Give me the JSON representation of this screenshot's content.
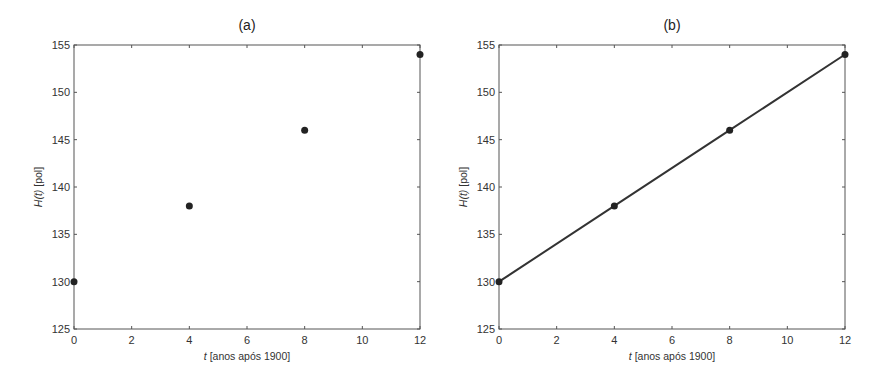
{
  "chart_data": [
    {
      "type": "scatter",
      "title": "(a)",
      "xlabel_italic": "t",
      "xlabel_rest": " [anos após 1900]",
      "ylabel_italic": "H(t)",
      "ylabel_rest": " [pol]",
      "xlabel": "t [anos após 1900]",
      "ylabel": "H(t) [pol]",
      "xlim": [
        0,
        12
      ],
      "ylim": [
        125,
        155
      ],
      "xticks": [
        0,
        2,
        4,
        6,
        8,
        10,
        12
      ],
      "yticks": [
        125,
        130,
        135,
        140,
        145,
        150,
        155
      ],
      "grid": false,
      "series": [
        {
          "name": "dados",
          "x": [
            0,
            4,
            8,
            12
          ],
          "y": [
            130,
            138,
            146,
            154
          ],
          "marker": "circle",
          "line": false
        }
      ]
    },
    {
      "type": "line",
      "title": "(b)",
      "xlabel_italic": "t",
      "xlabel_rest": " [anos após 1900]",
      "ylabel_italic": "H(t)",
      "ylabel_rest": " [pol]",
      "xlabel": "t [anos após 1900]",
      "ylabel": "H(t) [pol]",
      "xlim": [
        0,
        12
      ],
      "ylim": [
        125,
        155
      ],
      "xticks": [
        0,
        2,
        4,
        6,
        8,
        10,
        12
      ],
      "yticks": [
        125,
        130,
        135,
        140,
        145,
        150,
        155
      ],
      "grid": false,
      "series": [
        {
          "name": "dados",
          "x": [
            0,
            4,
            8,
            12
          ],
          "y": [
            130,
            138,
            146,
            154
          ],
          "marker": "circle",
          "line": true
        }
      ]
    }
  ],
  "colors": {
    "axis": "#555555",
    "marker": "#222222",
    "line": "#333333"
  }
}
